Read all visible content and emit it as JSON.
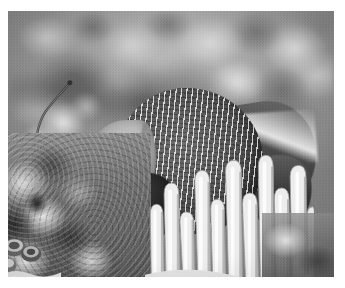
{
  "image": {
    "kind": "photograph",
    "medium": "underwater-photograph",
    "color_mode": "grayscale",
    "title": "Gray angelfish over coral reef",
    "caption": "",
    "frame": {
      "canvas_width_px": 345,
      "canvas_height_px": 288,
      "border_color": "#ffffff",
      "photo_left_px": 8,
      "photo_top_px": 11,
      "photo_width_px": 326,
      "photo_height_px": 266
    },
    "palette": {
      "darkest": "#141414",
      "shadow": "#2e2e2e",
      "midtone": "#7e7e7e",
      "light": "#c8c8c8",
      "highlight": "#f2f2f2",
      "background_water": "#8d8d8d"
    },
    "subjects": [
      {
        "name": "gray-angelfish",
        "label": "Gray angelfish",
        "position": "center",
        "features": [
          "pale-head",
          "dark-eye",
          "speckled-scales",
          "dark-pectoral-fin",
          "trailing-dorsal-fin",
          "trailing-tail"
        ]
      },
      {
        "name": "finger-coral",
        "label": "Finger coral",
        "position": "foreground-bottom-center-right"
      },
      {
        "name": "plate-coral",
        "label": "Plate and cup coral",
        "position": "foreground-bottom-left"
      },
      {
        "name": "sea-whip",
        "label": "Sea whip",
        "position": "upper-left"
      },
      {
        "name": "reef-background",
        "label": "Blurred reef and algae",
        "position": "background-top"
      }
    ]
  }
}
